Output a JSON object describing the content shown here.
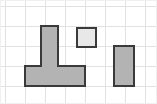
{
  "canvas": {
    "width": 157,
    "height": 104,
    "background_color": "#ffffff",
    "frame": {
      "x": 0,
      "y": 0,
      "width": 157,
      "height": 104,
      "stroke_color": "#f0f0f0",
      "stroke_width": 1
    }
  },
  "grid": {
    "visible": true,
    "cell_size": 20,
    "line_color": "#e2e2e2",
    "line_width": 1,
    "vertical_lines": [
      5,
      25,
      45,
      65,
      85,
      105,
      125,
      145
    ],
    "horizontal_lines": [
      6,
      26,
      46,
      66,
      86
    ]
  },
  "style": {
    "stroke_color": "#3a3a3a",
    "stroke_width": 2,
    "fill_gray": "#b3b3b3",
    "fill_light": "#e8e8e8"
  },
  "shapes": [
    {
      "name": "t-shape",
      "type": "polygon",
      "fill": "#b3b3b3",
      "stroke": "#3a3a3a",
      "stroke_width": 2,
      "points": "41,26 58,26 58,66 85,66 85,86 25,86 25,66 41,66",
      "grid_cells": 8,
      "bounds": {
        "x": 25,
        "y": 26,
        "width": 60,
        "height": 60
      }
    },
    {
      "name": "small-square",
      "type": "rect",
      "fill": "#e8e8e8",
      "stroke": "#3a3a3a",
      "stroke_width": 2,
      "x": 77,
      "y": 28,
      "width": 19,
      "height": 19,
      "grid_cells": 1
    },
    {
      "name": "tall-rectangle",
      "type": "rect",
      "fill": "#b3b3b3",
      "stroke": "#3a3a3a",
      "stroke_width": 2,
      "x": 114,
      "y": 46,
      "width": 20,
      "height": 40,
      "grid_cells": 2
    }
  ]
}
